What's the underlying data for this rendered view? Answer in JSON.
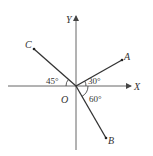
{
  "header": {
    "cropped_text": ""
  },
  "diagram": {
    "axes": {
      "x_label": "X",
      "y_label": "Y",
      "origin_label": "O"
    },
    "rays": [
      {
        "name": "OA",
        "label": "A",
        "angle_from_positive_x": "30°"
      },
      {
        "name": "OB",
        "label": "B",
        "angle_from_positive_x": "60°"
      },
      {
        "name": "OC",
        "label": "C",
        "angle_from_negative_x": "45°"
      }
    ],
    "angle_labels": {
      "a45": "45°",
      "a30": "30°",
      "a60": "60°"
    },
    "colors": {
      "line": "#333333",
      "axis": "#666666"
    }
  }
}
